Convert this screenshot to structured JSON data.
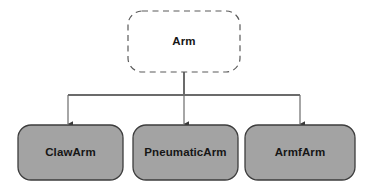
{
  "diagram": {
    "type": "class-inheritance-hierarchy",
    "background_color": "#ffffff",
    "root": {
      "label": "Arm",
      "style": "dashed",
      "fill_color": "#ffffff",
      "border_color": "#5a5a5a",
      "text_color": "#161616",
      "x": 128,
      "y": 11,
      "width": 112,
      "height": 61,
      "corner_radius": 14
    },
    "connector": {
      "line_color": "#6b6b6b",
      "arrow_color": "#3a3a3a",
      "trunk_from_y": 72,
      "bus_y": 95,
      "bus_left_x": 68,
      "bus_right_x": 300,
      "arrow_tip_y": 124
    },
    "children": [
      {
        "label": "ClawArm",
        "style": "solid",
        "fill_color": "#a3a3a3",
        "border_color": "#3d3d3d",
        "text_color": "#161616",
        "x": 18,
        "y": 125,
        "width": 105,
        "height": 55,
        "corner_radius": 13,
        "arrow_x": 68
      },
      {
        "label": "PneumaticArm",
        "style": "solid",
        "fill_color": "#a3a3a3",
        "border_color": "#3d3d3d",
        "text_color": "#161616",
        "x": 133,
        "y": 125,
        "width": 105,
        "height": 55,
        "corner_radius": 13,
        "arrow_x": 184
      },
      {
        "label": "ArmfArm",
        "style": "solid",
        "fill_color": "#a3a3a3",
        "border_color": "#3d3d3d",
        "text_color": "#161616",
        "x": 245,
        "y": 125,
        "width": 110,
        "height": 55,
        "corner_radius": 13,
        "arrow_x": 300
      }
    ]
  }
}
